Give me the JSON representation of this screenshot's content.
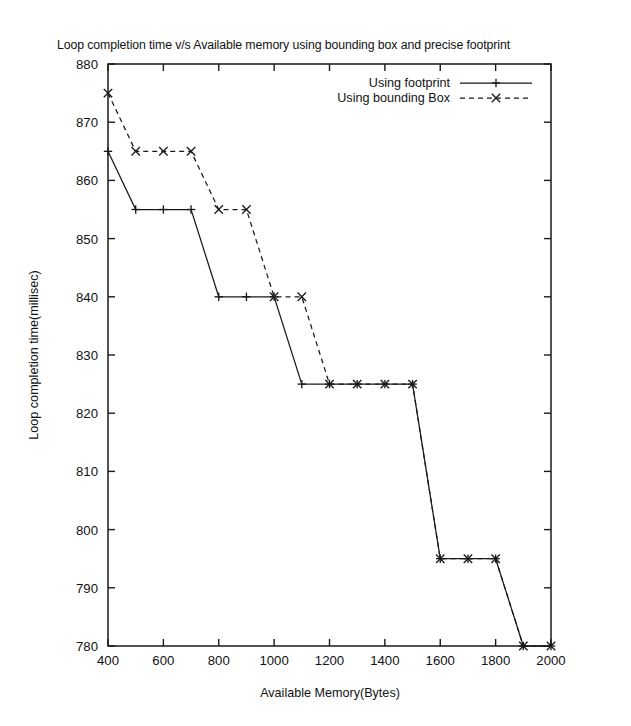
{
  "chart_data": {
    "type": "line",
    "title": "Loop completion time v/s Available memory using bounding box and precise footprint",
    "xlabel": "Available Memory(Bytes)",
    "ylabel": "Loop completion time(millisec)",
    "xlim": [
      400,
      2000
    ],
    "ylim": [
      780,
      880
    ],
    "xticks": [
      400,
      600,
      800,
      1000,
      1200,
      1400,
      1600,
      1800,
      2000
    ],
    "yticks": [
      780,
      790,
      800,
      810,
      820,
      830,
      840,
      850,
      860,
      870,
      880
    ],
    "grid": false,
    "legend_position": "top-right",
    "x": [
      400,
      500,
      600,
      700,
      800,
      900,
      1000,
      1100,
      1200,
      1300,
      1400,
      1500,
      1600,
      1700,
      1800,
      1900,
      2000
    ],
    "series": [
      {
        "name": "Using footprint",
        "style": "solid",
        "marker": "plus",
        "values": [
          865,
          855,
          855,
          855,
          840,
          840,
          840,
          825,
          825,
          825,
          825,
          825,
          795,
          795,
          795,
          780,
          780
        ]
      },
      {
        "name": "Using bounding Box",
        "style": "dashed",
        "marker": "x",
        "values": [
          875,
          865,
          865,
          865,
          855,
          855,
          840,
          840,
          825,
          825,
          825,
          825,
          795,
          795,
          795,
          780,
          780
        ]
      }
    ]
  },
  "legend": {
    "entries": [
      {
        "label": "Using footprint",
        "style": "solid",
        "marker": "plus"
      },
      {
        "label": "Using bounding Box",
        "style": "dashed",
        "marker": "x"
      }
    ]
  },
  "axes": {
    "x_title": "Available Memory(Bytes)",
    "y_title": "Loop completion time(millisec)",
    "x_tick_labels": [
      "400",
      "600",
      "800",
      "1000",
      "1200",
      "1400",
      "1600",
      "1800",
      "2000"
    ],
    "y_tick_labels": [
      "780",
      "790",
      "800",
      "810",
      "820",
      "830",
      "840",
      "850",
      "860",
      "870",
      "880"
    ]
  },
  "colors": {
    "ink": "#1a1a1a",
    "background": "#ffffff"
  }
}
